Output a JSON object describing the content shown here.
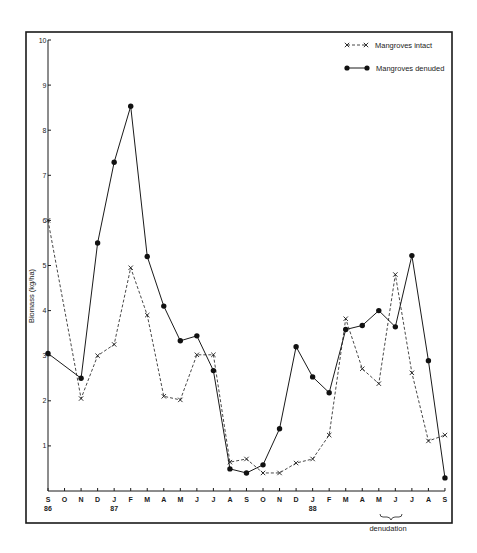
{
  "chart_data": {
    "type": "line",
    "title": "",
    "xlabel": "",
    "ylabel": "Biomass (kg/ha)",
    "ylim": [
      0,
      10
    ],
    "yticks": [
      "1",
      "2",
      "3",
      "4",
      "5",
      "6",
      "7",
      "8",
      "9",
      "10"
    ],
    "grid": false,
    "legend_position": "top-right",
    "categories": [
      "S",
      "O",
      "N",
      "D",
      "J",
      "F",
      "M",
      "A",
      "M",
      "J",
      "J",
      "A",
      "S",
      "O",
      "N",
      "D",
      "J",
      "F",
      "M",
      "A",
      "M",
      "J",
      "J",
      "A",
      "S"
    ],
    "year_labels": [
      {
        "index": 0,
        "label": "86"
      },
      {
        "index": 4,
        "label": "87"
      },
      {
        "index": 16,
        "label": "88"
      }
    ],
    "annotations": [
      {
        "text": "denudation",
        "from_index": 20,
        "to_index": 21
      }
    ],
    "series": [
      {
        "name": "Mangroves intact",
        "style": "dashed-x",
        "values": [
          6.0,
          null,
          2.05,
          3.0,
          3.25,
          4.95,
          3.9,
          2.1,
          2.02,
          3.02,
          3.02,
          0.64,
          0.71,
          0.4,
          0.4,
          0.62,
          0.71,
          1.24,
          3.82,
          2.71,
          2.38,
          4.8,
          2.62,
          1.11,
          1.24
        ]
      },
      {
        "name": "Mangroves denuded",
        "style": "solid-dot",
        "values": [
          3.05,
          null,
          2.5,
          5.5,
          7.29,
          8.53,
          5.2,
          4.1,
          3.33,
          3.44,
          2.67,
          0.49,
          0.4,
          0.58,
          1.38,
          3.2,
          2.53,
          2.18,
          3.58,
          3.67,
          4.0,
          3.64,
          5.22,
          2.89,
          0.29
        ]
      }
    ]
  },
  "legend": {
    "intact_label": "Mangroves intact",
    "denuded_label": "Mangroves denuded"
  },
  "axis": {
    "y_label": "Biomass (kg/ha)",
    "annotation": "denudation"
  }
}
